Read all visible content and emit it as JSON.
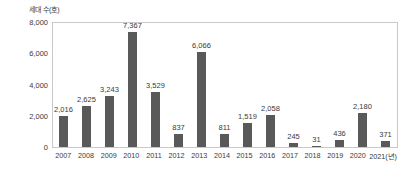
{
  "chart_data": {
    "type": "bar",
    "title": "",
    "subtitle": "",
    "ylabel": "세대 수(호)",
    "xlabel": "",
    "xunit": "(년)",
    "ylim": [
      0,
      8000
    ],
    "yticks": [
      "0",
      "2,000",
      "4,000",
      "6,000",
      "8,000"
    ],
    "ytick_values": [
      0,
      2000,
      4000,
      6000,
      8000
    ],
    "grid": false,
    "legend": null,
    "bar_color": "#595959",
    "categories": [
      "2007",
      "2008",
      "2009",
      "2010",
      "2011",
      "2012",
      "2013",
      "2014",
      "2015",
      "2016",
      "2017",
      "2018",
      "2019",
      "2020",
      "2021"
    ],
    "x_tick_labels": [
      "2007",
      "2008",
      "2009",
      "2010",
      "2011",
      "2012",
      "2013",
      "2014",
      "2015",
      "2016",
      "2017",
      "2018",
      "2019",
      "2020",
      "2021(년)"
    ],
    "values": [
      2016,
      2625,
      3243,
      7367,
      3529,
      837,
      6066,
      811,
      1519,
      2058,
      245,
      31,
      436,
      2180,
      371
    ],
    "data_labels": [
      "2,016",
      "2,625",
      "3,243",
      "7,367",
      "3,529",
      "837",
      "6,066",
      "811",
      "1,519",
      "2,058",
      "245",
      "31",
      "436",
      "2,180",
      "371"
    ]
  }
}
